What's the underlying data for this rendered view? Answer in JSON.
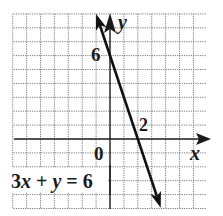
{
  "chart_data": {
    "type": "line",
    "title": "",
    "equation": "3x + y = 6",
    "equation_parts": {
      "coef": "3",
      "xvar": "x",
      "plus": " + ",
      "yvar": "y",
      "rhs": " = 6"
    },
    "xlabel": "x",
    "ylabel": "y",
    "xlim": [
      -7,
      7
    ],
    "ylim": [
      -5,
      9
    ],
    "grid": true,
    "grid_step": 1,
    "tick_labels": [
      {
        "text": "0",
        "x": 0,
        "y": 0,
        "role": "origin"
      },
      {
        "text": "6",
        "x": 0,
        "y": 6,
        "role": "y-intercept"
      },
      {
        "text": "2",
        "x": 2,
        "y": 0,
        "role": "x-intercept"
      }
    ],
    "series": [
      {
        "name": "3x + y = 6",
        "slope": -3,
        "intercept": 6,
        "points": [
          {
            "x": -1,
            "y": 9
          },
          {
            "x": 0,
            "y": 6
          },
          {
            "x": 2,
            "y": 0
          },
          {
            "x": 3.65,
            "y": -4.95
          }
        ],
        "arrows": "both"
      }
    ],
    "intercepts": {
      "x_intercept": [
        2,
        0
      ],
      "y_intercept": [
        0,
        6
      ]
    },
    "colors": {
      "line": "#111111",
      "grid": "#6e6e6e",
      "axis": "#1a1a1a",
      "background": "#ffffff"
    }
  },
  "labels": {
    "origin": "0",
    "y_intercept": "6",
    "x_intercept": "2",
    "x_axis": "x",
    "y_axis": "y"
  }
}
